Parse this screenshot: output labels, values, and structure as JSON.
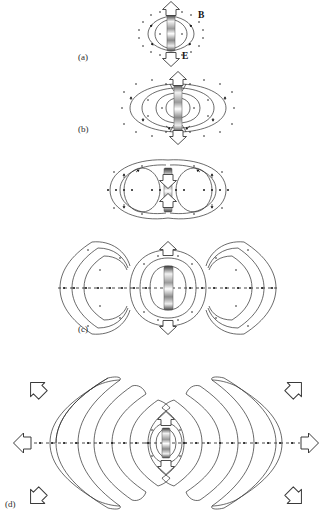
{
  "figure": {
    "background_color": "#ffffff",
    "line_color": "#2b2b2b",
    "dot_color": "#1a1a1a",
    "arrow_outline_color": "#3a3a3a",
    "dipole_color": "#8a8a8a"
  },
  "panels": [
    {
      "id": "a",
      "label": "(a)",
      "label_x": 78,
      "label_y": 57,
      "caption_stage": "near field, first quarter cycle",
      "center_x": 171,
      "center_y": 33,
      "loop_count": 1,
      "half_width": 34,
      "half_height": 26
    },
    {
      "id": "b",
      "label": "(b)",
      "label_x": 78,
      "label_y": 128,
      "caption_stage": "field lines begin to close on themselves",
      "center_x": 178,
      "center_y": 108,
      "loop_count": 3,
      "half_width": 52,
      "half_height": 30
    },
    {
      "id": "c",
      "label": "(c)",
      "label_x": 78,
      "label_y": 328,
      "caption_stage": "closed loops detach and travel outward",
      "center_x": 168,
      "center_y": 288,
      "loop_count": 4,
      "half_width": 106,
      "half_height": 62
    },
    {
      "id": "d",
      "label": "(d)",
      "label_x": 6,
      "label_y": 503,
      "caption_stage": "far field radiation pattern",
      "center_x": 166,
      "center_y": 443,
      "loop_count": 7,
      "half_width": 160,
      "half_height": 88
    }
  ],
  "field_labels": [
    {
      "symbol": "B",
      "x": 198,
      "y": 14,
      "meaning": "magnetic-field"
    },
    {
      "symbol": "E",
      "x": 181,
      "y": 54,
      "meaning": "electric-field"
    }
  ],
  "arrows": {
    "vertical_label": "E-field oscillation direction",
    "radial_label": "propagation direction"
  }
}
